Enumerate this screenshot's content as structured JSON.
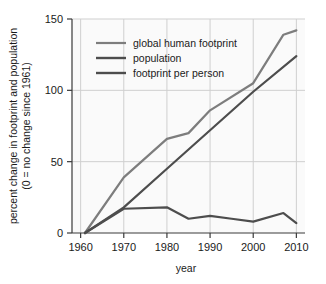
{
  "chart_data": {
    "type": "line",
    "title": "",
    "xlabel": "year",
    "ylabel": "percent change in footprint and population (0 = no change since 1961)",
    "ylabel_line1": "percent change in footprint and population",
    "ylabel_line2": "(0 = no change since 1961)",
    "xlim": [
      1958,
      2012
    ],
    "ylim": [
      0,
      150
    ],
    "xticks": [
      1960,
      1970,
      1980,
      1990,
      2000,
      2010
    ],
    "xticklabels": [
      "1960",
      "1970",
      "1980",
      "1990",
      "2000",
      "2010"
    ],
    "yticks": [
      0,
      50,
      100,
      150
    ],
    "yticklabels": [
      "0",
      "50",
      "100",
      "150"
    ],
    "grid": true,
    "legend_position": "upper-left-inside",
    "series": [
      {
        "name": "global human footprint",
        "color": "#7d7d7d",
        "x": [
          1961,
          1970,
          1980,
          1985,
          1990,
          2000,
          2007,
          2010
        ],
        "values": [
          0,
          39,
          66,
          70,
          86,
          105,
          139,
          142
        ]
      },
      {
        "name": "population",
        "color": "#4d4d4d",
        "x": [
          1961,
          1970,
          1980,
          1990,
          2000,
          2010
        ],
        "values": [
          0,
          18,
          45,
          72,
          99,
          124
        ]
      },
      {
        "name": "footprint per person",
        "color": "#4d4d4d",
        "x": [
          1961,
          1970,
          1980,
          1985,
          1990,
          1995,
          2000,
          2007,
          2010
        ],
        "values": [
          0,
          17,
          18,
          10,
          12,
          10,
          8,
          14,
          7
        ]
      }
    ]
  },
  "legend": {
    "items": [
      {
        "label": "global human footprint"
      },
      {
        "label": "population"
      },
      {
        "label": "footprint per person"
      }
    ]
  },
  "colors": {
    "footprint_line": "#7d7d7d",
    "population_line": "#4d4d4d",
    "per_person_line": "#4d4d4d",
    "axis": "#3a3a3a",
    "grid": "#cfcfcf",
    "plot_background": "#fafafa",
    "figure_background": "#ffffff",
    "text": "#1a1a1a"
  }
}
